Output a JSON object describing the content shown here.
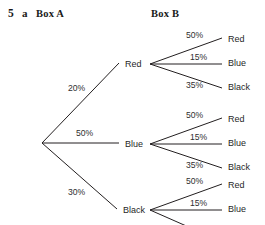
{
  "header": {
    "question_number": "5",
    "question_part": "a",
    "box_a_label": "Box A",
    "box_b_label": "Box B"
  },
  "chart_data": {
    "type": "diagram",
    "diagram_type": "probability-tree",
    "root": {
      "x": 42,
      "y": 143
    },
    "level1": [
      {
        "label": "Red",
        "probability": "20%",
        "pct_x": 68,
        "pct_y": 91,
        "node_x": 125,
        "node_y": 67,
        "vx": 150,
        "vy": 64
      },
      {
        "label": "Blue",
        "probability": "50%",
        "pct_x": 76,
        "pct_y": 136,
        "node_x": 125,
        "node_y": 147,
        "vx": 150,
        "vy": 144
      },
      {
        "label": "Black",
        "probability": "30%",
        "pct_x": 68,
        "pct_y": 195,
        "node_x": 123,
        "node_y": 213,
        "vx": 150,
        "vy": 210
      }
    ],
    "level2": [
      {
        "label": "Red",
        "probability": "50%"
      },
      {
        "label": "Blue",
        "probability": "15%"
      },
      {
        "label": "Black",
        "probability": "35%"
      }
    ],
    "subtrees": [
      {
        "parent": "Red",
        "vertex": {
          "x": 150,
          "y": 64
        },
        "branches": [
          {
            "probability": "50%",
            "label": "Red",
            "pct_x": 186,
            "pct_y": 38,
            "lx": 228,
            "ly": 42,
            "ex": 222,
            "ey": 38
          },
          {
            "probability": "15%",
            "label": "Blue",
            "pct_x": 190,
            "pct_y": 60,
            "lx": 228,
            "ly": 66,
            "ex": 222,
            "ey": 64
          },
          {
            "probability": "35%",
            "label": "Black",
            "pct_x": 186,
            "pct_y": 88,
            "lx": 228,
            "ly": 90,
            "ex": 222,
            "ey": 88
          }
        ]
      },
      {
        "parent": "Blue",
        "vertex": {
          "x": 150,
          "y": 144
        },
        "branches": [
          {
            "probability": "50%",
            "label": "Red",
            "pct_x": 186,
            "pct_y": 118,
            "lx": 228,
            "ly": 122,
            "ex": 222,
            "ey": 118
          },
          {
            "probability": "15%",
            "label": "Blue",
            "pct_x": 190,
            "pct_y": 140,
            "lx": 228,
            "ly": 146,
            "ex": 222,
            "ey": 144
          },
          {
            "probability": "35%",
            "label": "Black",
            "pct_x": 186,
            "pct_y": 168,
            "lx": 228,
            "ly": 170,
            "ex": 222,
            "ey": 168
          }
        ]
      },
      {
        "parent": "Black",
        "vertex": {
          "x": 150,
          "y": 210
        },
        "clipped": true,
        "branches": [
          {
            "probability": "50%",
            "label": "Red",
            "pct_x": 186,
            "pct_y": 184,
            "lx": 228,
            "ly": 188,
            "ex": 222,
            "ey": 184
          },
          {
            "probability": "15%",
            "label": "Blue",
            "pct_x": 190,
            "pct_y": 206,
            "lx": 228,
            "ly": 212,
            "ex": 222,
            "ey": 210
          }
        ]
      }
    ],
    "colors": {
      "line": "#231f20",
      "percent_text": "#2f2f2f",
      "node_text": "#1f1f1f",
      "heading_text": "#1a1a1a",
      "background": "#ffffff"
    }
  }
}
